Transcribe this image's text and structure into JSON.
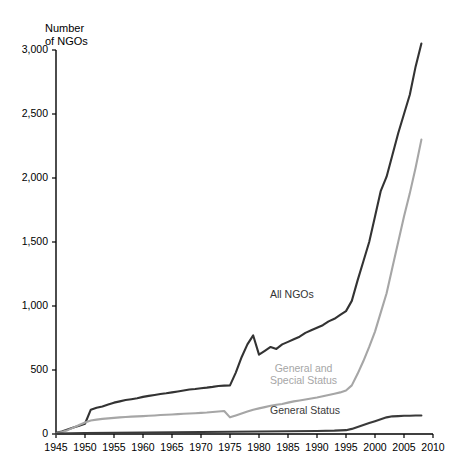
{
  "chart_data": {
    "type": "line",
    "title": "",
    "subtitle": "",
    "ylabel": "Number\nof NGOs",
    "xlabel": "",
    "xlim": [
      1945,
      2010
    ],
    "ylim": [
      0,
      3000
    ],
    "ytick_labels": [
      "0",
      "500",
      "1,000",
      "1,500",
      "2,000",
      "2,500",
      "3,000"
    ],
    "ytick_values": [
      0,
      500,
      1000,
      1500,
      2000,
      2500,
      3000
    ],
    "xtick_labels": [
      "1945",
      "1950",
      "1955",
      "1960",
      "1965",
      "1970",
      "1975",
      "1980",
      "1985",
      "1990",
      "1995",
      "2000",
      "2005",
      "2010"
    ],
    "xtick_values": [
      1945,
      1950,
      1955,
      1960,
      1965,
      1970,
      1975,
      1980,
      1985,
      1990,
      1995,
      2000,
      2005,
      2010
    ],
    "grid": false,
    "legend_position": "inline-annotation",
    "series": [
      {
        "name": "All NGOs",
        "color": "#333333",
        "label_x": 1985,
        "label_y": 1080,
        "x": [
          1945,
          1946,
          1947,
          1948,
          1949,
          1950,
          1951,
          1952,
          1953,
          1954,
          1955,
          1956,
          1957,
          1958,
          1959,
          1960,
          1961,
          1962,
          1963,
          1964,
          1965,
          1966,
          1967,
          1968,
          1969,
          1970,
          1971,
          1972,
          1973,
          1974,
          1975,
          1976,
          1977,
          1978,
          1979,
          1980,
          1981,
          1982,
          1983,
          1984,
          1985,
          1986,
          1987,
          1988,
          1989,
          1990,
          1991,
          1992,
          1993,
          1994,
          1995,
          1996,
          1997,
          1998,
          1999,
          2000,
          2001,
          2002,
          2003,
          2004,
          2005,
          2006,
          2007,
          2008
        ],
        "values": [
          10,
          20,
          35,
          50,
          65,
          80,
          190,
          205,
          215,
          230,
          245,
          255,
          265,
          272,
          280,
          290,
          298,
          305,
          312,
          318,
          325,
          332,
          340,
          348,
          352,
          358,
          362,
          368,
          375,
          378,
          380,
          480,
          600,
          700,
          770,
          620,
          650,
          680,
          665,
          700,
          720,
          740,
          760,
          790,
          810,
          830,
          850,
          880,
          900,
          930,
          960,
          1040,
          1200,
          1350,
          1500,
          1700,
          1900,
          2010,
          2180,
          2350,
          2500,
          2650,
          2870,
          3050
        ]
      },
      {
        "name": "General and\nSpecial Status",
        "color": "#a6a6a6",
        "label_x": 1985,
        "label_y": 500,
        "x": [
          1945,
          1946,
          1947,
          1948,
          1949,
          1950,
          1951,
          1952,
          1953,
          1954,
          1955,
          1956,
          1957,
          1958,
          1959,
          1960,
          1961,
          1962,
          1963,
          1964,
          1965,
          1966,
          1967,
          1968,
          1969,
          1970,
          1971,
          1972,
          1973,
          1974,
          1975,
          1976,
          1977,
          1978,
          1979,
          1980,
          1981,
          1982,
          1983,
          1984,
          1985,
          1986,
          1987,
          1988,
          1989,
          1990,
          1991,
          1992,
          1993,
          1994,
          1995,
          1996,
          1997,
          1998,
          1999,
          2000,
          2001,
          2002,
          2003,
          2004,
          2005,
          2006,
          2007,
          2008
        ],
        "values": [
          5,
          15,
          30,
          50,
          70,
          90,
          105,
          112,
          118,
          122,
          126,
          130,
          133,
          136,
          138,
          140,
          142,
          145,
          148,
          150,
          152,
          155,
          158,
          160,
          162,
          165,
          168,
          172,
          176,
          180,
          130,
          145,
          160,
          175,
          190,
          200,
          210,
          220,
          228,
          235,
          245,
          255,
          262,
          270,
          278,
          285,
          295,
          305,
          315,
          325,
          340,
          380,
          470,
          570,
          680,
          800,
          950,
          1100,
          1300,
          1500,
          1700,
          1880,
          2080,
          2300
        ]
      },
      {
        "name": "General Status",
        "color": "#3a3a3a",
        "label_x": 1985,
        "label_y": 175,
        "x": [
          1945,
          1950,
          1955,
          1960,
          1965,
          1970,
          1975,
          1980,
          1985,
          1990,
          1993,
          1995,
          1996,
          1997,
          1998,
          1999,
          2000,
          2001,
          2002,
          2003,
          2004,
          2005,
          2006,
          2007,
          2008
        ],
        "values": [
          3,
          8,
          10,
          12,
          14,
          16,
          18,
          20,
          22,
          24,
          26,
          30,
          40,
          55,
          70,
          85,
          100,
          115,
          130,
          138,
          140,
          142,
          143,
          144,
          145
        ]
      }
    ]
  }
}
